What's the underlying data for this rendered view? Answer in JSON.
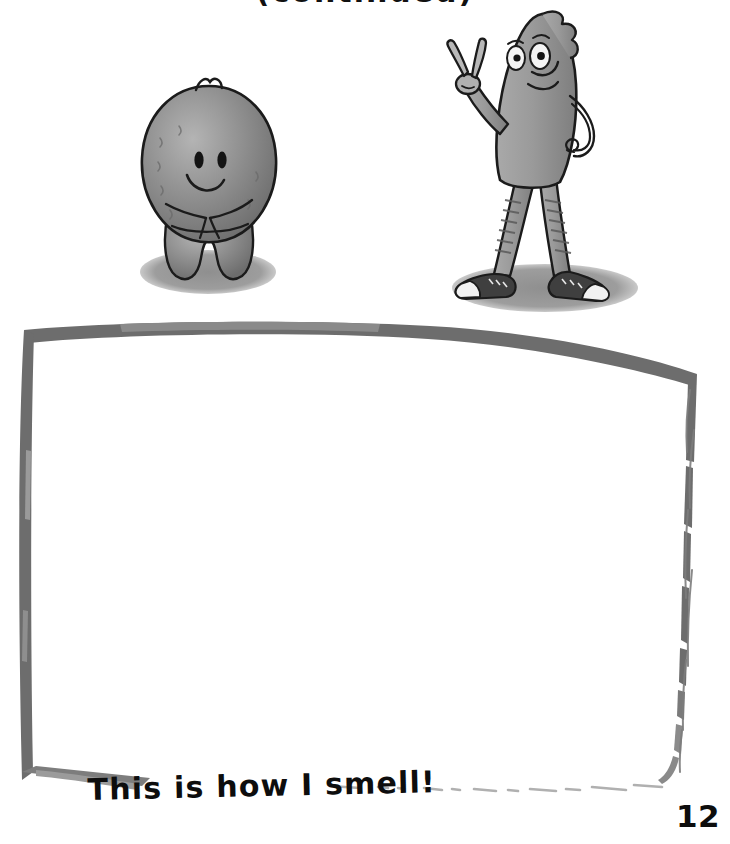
{
  "page": {
    "background_color": "#ffffff",
    "width": 730,
    "height": 844
  },
  "header": {
    "text": "(continued)",
    "note": "cut off at top edge of page; only descender tips visible"
  },
  "illustration": {
    "title": "two cartoon characters standing above an empty drawing box",
    "characters": [
      {
        "name": "fuzzy-blob-character",
        "description": "small rounded furry blob with two oval eyes, a smile, arms folded in front and two short legs",
        "body_color": "#8e8e8e",
        "outline_color": "#1d1d1d",
        "shadow_color": "#9a9a9a"
      },
      {
        "name": "tall-teardrop-character",
        "description": "tall teardrop shaped figure with a quiff, big eyes, smile, right hand making a peace sign, left hand on hip, striped socks and high-top sneakers",
        "body_color": "#9b9b9b",
        "outline_color": "#1d1d1d",
        "shoe_color": "#3a3a3a",
        "shoe_toe_color": "#f2f2f2",
        "shadow_color": "#9a9a9a"
      }
    ]
  },
  "drawing_box": {
    "name": "empty-drawing-area",
    "fill_color": "#ffffff",
    "border_color": "#6b6b6b",
    "border_style": "rough hand-drawn brush stroke, faded along the bottom and right edges"
  },
  "caption": {
    "text": "This is how I smell!",
    "color": "#0d0d0d"
  },
  "page_number": {
    "value": "12",
    "color": "#0d0d0d"
  }
}
